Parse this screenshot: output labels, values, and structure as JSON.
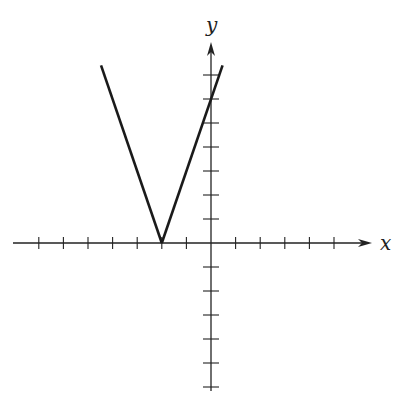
{
  "chart_data": {
    "type": "line",
    "title": "",
    "xlabel": "x",
    "ylabel": "y",
    "function": "y = 3|x + 2|",
    "vertex": [
      -2,
      0
    ],
    "series": [
      {
        "name": "left branch",
        "x": [
          -4.47,
          -2
        ],
        "y": [
          7.4,
          0
        ]
      },
      {
        "name": "right branch",
        "x": [
          -2,
          0.47
        ],
        "y": [
          0,
          7.4
        ]
      }
    ],
    "xlim": [
      -8,
      6
    ],
    "ylim": [
      -6,
      8
    ],
    "x_ticks": [
      -7,
      -6,
      -5,
      -4,
      -3,
      -2,
      -1,
      1,
      2,
      3,
      4,
      5
    ],
    "y_ticks": [
      -6,
      -5,
      -4,
      -3,
      -2,
      -1,
      1,
      2,
      3,
      4,
      5,
      6,
      7
    ],
    "tick_labels_shown": false,
    "grid": false,
    "legend": null,
    "line_color": "#1a1a1a"
  },
  "axes": {
    "x_label": "x",
    "y_label": "y"
  },
  "layout": {
    "origin_px": [
      211,
      243
    ],
    "unit_px_x": 24.6,
    "unit_px_y": 24.0,
    "x_axis_px": [
      13,
      372
    ],
    "y_axis_px": [
      391,
      42
    ]
  }
}
